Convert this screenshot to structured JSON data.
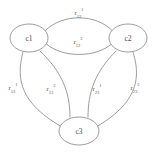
{
  "diagram": {
    "background_color": "#ffffff",
    "stroke_color": "#8a8a8a",
    "text_color": "#5a5a5a",
    "nodes": [
      {
        "id": "c1",
        "label": "c1",
        "cx": 29,
        "cy": 38,
        "rx": 19,
        "ry": 14
      },
      {
        "id": "c2",
        "label": "c2",
        "cx": 128,
        "cy": 38,
        "rx": 19,
        "ry": 14
      },
      {
        "id": "c3",
        "label": "c3",
        "cx": 79,
        "cy": 131,
        "rx": 20,
        "ry": 14
      }
    ],
    "edges": [
      {
        "id": "e12a",
        "from": "c1",
        "to": "c2",
        "base": "r",
        "sub": "12",
        "sup": "1",
        "label_x": 79,
        "label_y": 13
      },
      {
        "id": "e12b",
        "from": "c1",
        "to": "c2",
        "base": "r",
        "sub": "12",
        "sup": "2",
        "label_x": 78,
        "label_y": 42
      },
      {
        "id": "e13a",
        "from": "c1",
        "to": "c3",
        "base": "r",
        "sub": "13",
        "sup": "1",
        "label_x": 13,
        "label_y": 88
      },
      {
        "id": "e13b",
        "from": "c1",
        "to": "c3",
        "base": "r",
        "sub": "13",
        "sup": "2",
        "label_x": 51,
        "label_y": 89
      },
      {
        "id": "e23a",
        "from": "c2",
        "to": "c3",
        "base": "r",
        "sub": "23",
        "sup": "1",
        "label_x": 97,
        "label_y": 89
      },
      {
        "id": "e23b",
        "from": "c2",
        "to": "c3",
        "base": "r",
        "sub": "23",
        "sup": "2",
        "label_x": 135,
        "label_y": 88
      }
    ],
    "edge_paths": {
      "e12a": "M 45.5 30.5 C 62 13.5, 96 13.5, 112 30.5",
      "e12b": "M 46.5 44 C 62 58, 96 58, 111.5 44",
      "e13a": "M 23 52 C 18 72, 14 100, 62 127",
      "e13b": "M 40 51 C 62 72, 70 92, 70 117",
      "e23a": "M 116 51 C 95 72, 88 92, 88 117",
      "e23b": "M 133 52 C 139 72, 143 100, 96 127"
    }
  }
}
